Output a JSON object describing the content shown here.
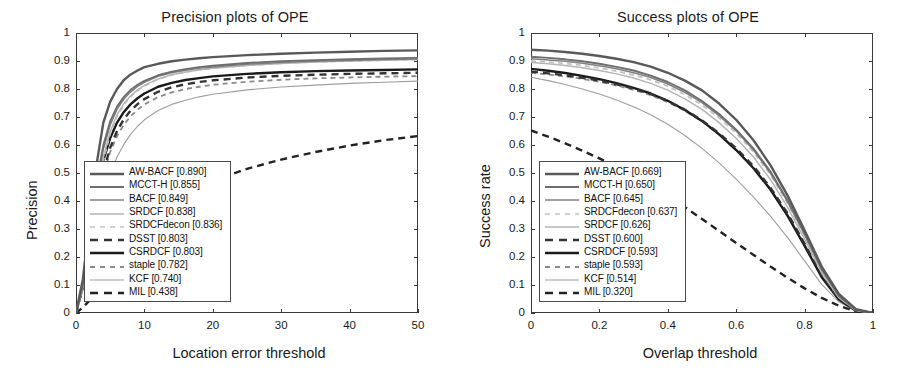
{
  "figure": {
    "background": "#ffffff",
    "panels": [
      "precision",
      "success"
    ]
  },
  "precision_panel": {
    "title": "Precision plots of OPE",
    "xlabel": "Location error threshold",
    "ylabel": "Precision",
    "xticks": [
      "0",
      "10",
      "20",
      "30",
      "40",
      "50"
    ],
    "yticks": [
      "0",
      "0.1",
      "0.2",
      "0.3",
      "0.4",
      "0.5",
      "0.6",
      "0.7",
      "0.8",
      "0.9",
      "1"
    ],
    "legend": [
      {
        "label": "AW-BACF [0.890]",
        "color": "#595959",
        "style": "solid",
        "width": 2.6
      },
      {
        "label": "MCCT-H [0.855]",
        "color": "#6e6e6e",
        "style": "solid",
        "width": 2.0
      },
      {
        "label": "BACF [0.849]",
        "color": "#808080",
        "style": "solid",
        "width": 1.7
      },
      {
        "label": "SRDCF [0.838]",
        "color": "#b5b5b5",
        "style": "solid",
        "width": 1.5
      },
      {
        "label": "SRDCFdecon [0.836]",
        "color": "#c2c2c2",
        "style": "dashed",
        "width": 1.7
      },
      {
        "label": "DSST [0.803]",
        "color": "#333333",
        "style": "dashed",
        "width": 2.6
      },
      {
        "label": "CSRDCF [0.803]",
        "color": "#1a1a1a",
        "style": "solid",
        "width": 2.6
      },
      {
        "label": "staple [0.782]",
        "color": "#8a8a8a",
        "style": "dashed",
        "width": 1.9
      },
      {
        "label": "KCF [0.740]",
        "color": "#9e9e9e",
        "style": "solid",
        "width": 1.2
      },
      {
        "label": "MIL [0.438]",
        "color": "#222222",
        "style": "dashed",
        "width": 2.4
      }
    ]
  },
  "success_panel": {
    "title": "Success plots of OPE",
    "xlabel": "Overlap threshold",
    "ylabel": "Success rate",
    "xticks": [
      "0",
      "0.2",
      "0.4",
      "0.6",
      "0.8",
      "1"
    ],
    "yticks": [
      "0",
      "0.1",
      "0.2",
      "0.3",
      "0.4",
      "0.5",
      "0.6",
      "0.7",
      "0.8",
      "0.9",
      "1"
    ],
    "legend": [
      {
        "label": "AW-BACF [0.669]",
        "color": "#595959",
        "style": "solid",
        "width": 2.6
      },
      {
        "label": "MCCT-H [0.650]",
        "color": "#6e6e6e",
        "style": "solid",
        "width": 2.0
      },
      {
        "label": "BACF [0.645]",
        "color": "#808080",
        "style": "solid",
        "width": 1.7
      },
      {
        "label": "SRDCFdecon [0.637]",
        "color": "#c2c2c2",
        "style": "dashed",
        "width": 1.7
      },
      {
        "label": "SRDCF [0.626]",
        "color": "#b5b5b5",
        "style": "solid",
        "width": 1.5
      },
      {
        "label": "DSST [0.600]",
        "color": "#333333",
        "style": "dashed",
        "width": 2.6
      },
      {
        "label": "CSRDCF [0.593]",
        "color": "#1a1a1a",
        "style": "solid",
        "width": 2.6
      },
      {
        "label": "staple [0.593]",
        "color": "#8a8a8a",
        "style": "dashed",
        "width": 1.9
      },
      {
        "label": "KCF [0.514]",
        "color": "#9e9e9e",
        "style": "solid",
        "width": 1.2
      },
      {
        "label": "MIL [0.320]",
        "color": "#222222",
        "style": "dashed",
        "width": 2.4
      }
    ]
  },
  "chart_data": [
    {
      "type": "line",
      "title": "Precision plots of OPE",
      "xlabel": "Location error threshold",
      "ylabel": "Precision",
      "xlim": [
        0,
        50
      ],
      "ylim": [
        0,
        1
      ],
      "grid": false,
      "legend_position": "lower-left",
      "x": [
        0,
        1,
        2,
        3,
        4,
        5,
        6,
        7,
        8,
        9,
        10,
        12,
        14,
        16,
        18,
        20,
        25,
        30,
        35,
        40,
        45,
        50
      ],
      "series": [
        {
          "name": "AW-BACF",
          "auc": 0.89,
          "color": "#595959",
          "style": "solid",
          "values": [
            0.0,
            0.12,
            0.33,
            0.53,
            0.68,
            0.755,
            0.8,
            0.832,
            0.852,
            0.866,
            0.878,
            0.89,
            0.899,
            0.905,
            0.91,
            0.914,
            0.921,
            0.926,
            0.93,
            0.933,
            0.936,
            0.938
          ]
        },
        {
          "name": "MCCT-H",
          "auc": 0.855,
          "color": "#6e6e6e",
          "style": "solid",
          "values": [
            0.0,
            0.1,
            0.29,
            0.47,
            0.6,
            0.685,
            0.737,
            0.772,
            0.797,
            0.815,
            0.829,
            0.849,
            0.862,
            0.871,
            0.878,
            0.883,
            0.893,
            0.899,
            0.903,
            0.906,
            0.909,
            0.911
          ]
        },
        {
          "name": "BACF",
          "auc": 0.849,
          "color": "#808080",
          "style": "solid",
          "values": [
            0.0,
            0.1,
            0.28,
            0.45,
            0.585,
            0.672,
            0.727,
            0.764,
            0.79,
            0.809,
            0.824,
            0.845,
            0.858,
            0.867,
            0.874,
            0.879,
            0.888,
            0.895,
            0.899,
            0.902,
            0.905,
            0.907
          ]
        },
        {
          "name": "SRDCF",
          "auc": 0.838,
          "color": "#b5b5b5",
          "style": "solid",
          "values": [
            0.0,
            0.09,
            0.25,
            0.42,
            0.555,
            0.648,
            0.708,
            0.748,
            0.776,
            0.797,
            0.813,
            0.836,
            0.851,
            0.861,
            0.868,
            0.874,
            0.884,
            0.891,
            0.896,
            0.9,
            0.903,
            0.905
          ]
        },
        {
          "name": "SRDCFdecon",
          "auc": 0.836,
          "color": "#c2c2c2",
          "style": "dashed",
          "values": [
            0.0,
            0.09,
            0.25,
            0.41,
            0.545,
            0.64,
            0.702,
            0.744,
            0.773,
            0.794,
            0.811,
            0.835,
            0.85,
            0.86,
            0.868,
            0.874,
            0.885,
            0.892,
            0.897,
            0.9,
            0.903,
            0.905
          ]
        },
        {
          "name": "DSST",
          "auc": 0.803,
          "color": "#333333",
          "style": "dashed",
          "values": [
            0.0,
            0.09,
            0.24,
            0.385,
            0.505,
            0.59,
            0.65,
            0.692,
            0.723,
            0.746,
            0.764,
            0.79,
            0.806,
            0.817,
            0.825,
            0.831,
            0.841,
            0.847,
            0.851,
            0.854,
            0.856,
            0.858
          ]
        },
        {
          "name": "CSRDCF",
          "auc": 0.803,
          "color": "#1a1a1a",
          "style": "solid",
          "values": [
            0.0,
            0.1,
            0.27,
            0.43,
            0.545,
            0.625,
            0.68,
            0.718,
            0.746,
            0.767,
            0.784,
            0.808,
            0.822,
            0.832,
            0.839,
            0.845,
            0.854,
            0.86,
            0.864,
            0.866,
            0.868,
            0.87
          ]
        },
        {
          "name": "staple",
          "auc": 0.782,
          "color": "#8a8a8a",
          "style": "dashed",
          "values": [
            0.0,
            0.09,
            0.24,
            0.38,
            0.495,
            0.575,
            0.632,
            0.673,
            0.703,
            0.726,
            0.745,
            0.771,
            0.788,
            0.8,
            0.808,
            0.815,
            0.826,
            0.833,
            0.838,
            0.841,
            0.844,
            0.846
          ]
        },
        {
          "name": "KCF",
          "auc": 0.74,
          "color": "#9e9e9e",
          "style": "solid",
          "values": [
            0.0,
            0.08,
            0.2,
            0.315,
            0.415,
            0.495,
            0.557,
            0.603,
            0.639,
            0.667,
            0.69,
            0.723,
            0.745,
            0.76,
            0.772,
            0.781,
            0.797,
            0.807,
            0.814,
            0.82,
            0.824,
            0.828
          ]
        },
        {
          "name": "MIL",
          "auc": 0.438,
          "color": "#222222",
          "style": "dashed",
          "values": [
            0.0,
            0.02,
            0.045,
            0.075,
            0.11,
            0.145,
            0.18,
            0.215,
            0.248,
            0.278,
            0.305,
            0.352,
            0.392,
            0.425,
            0.45,
            0.472,
            0.515,
            0.548,
            0.575,
            0.598,
            0.617,
            0.632
          ]
        }
      ]
    },
    {
      "type": "line",
      "title": "Success plots of OPE",
      "xlabel": "Overlap threshold",
      "ylabel": "Success rate",
      "xlim": [
        0,
        1
      ],
      "ylim": [
        0,
        1
      ],
      "grid": false,
      "legend_position": "lower-left",
      "x": [
        0,
        0.05,
        0.1,
        0.15,
        0.2,
        0.25,
        0.3,
        0.35,
        0.4,
        0.45,
        0.5,
        0.55,
        0.6,
        0.65,
        0.7,
        0.75,
        0.8,
        0.85,
        0.9,
        0.95,
        1.0
      ],
      "series": [
        {
          "name": "AW-BACF",
          "auc": 0.669,
          "color": "#595959",
          "style": "solid",
          "values": [
            0.94,
            0.937,
            0.932,
            0.926,
            0.918,
            0.908,
            0.896,
            0.88,
            0.858,
            0.83,
            0.795,
            0.748,
            0.69,
            0.618,
            0.528,
            0.42,
            0.295,
            0.166,
            0.068,
            0.014,
            0.0
          ]
        },
        {
          "name": "MCCT-H",
          "auc": 0.65,
          "color": "#6e6e6e",
          "style": "solid",
          "values": [
            0.915,
            0.911,
            0.906,
            0.899,
            0.89,
            0.879,
            0.866,
            0.848,
            0.825,
            0.795,
            0.757,
            0.711,
            0.655,
            0.588,
            0.505,
            0.403,
            0.284,
            0.158,
            0.062,
            0.012,
            0.0
          ]
        },
        {
          "name": "BACF",
          "auc": 0.645,
          "color": "#808080",
          "style": "solid",
          "values": [
            0.908,
            0.904,
            0.899,
            0.892,
            0.883,
            0.872,
            0.858,
            0.841,
            0.818,
            0.788,
            0.751,
            0.705,
            0.65,
            0.583,
            0.5,
            0.398,
            0.28,
            0.154,
            0.06,
            0.011,
            0.0
          ]
        },
        {
          "name": "SRDCFdecon",
          "auc": 0.637,
          "color": "#c2c2c2",
          "style": "dashed",
          "values": [
            0.9,
            0.896,
            0.891,
            0.884,
            0.875,
            0.864,
            0.85,
            0.833,
            0.81,
            0.78,
            0.743,
            0.697,
            0.642,
            0.576,
            0.494,
            0.392,
            0.275,
            0.15,
            0.058,
            0.01,
            0.0
          ]
        },
        {
          "name": "SRDCF",
          "auc": 0.626,
          "color": "#b5b5b5",
          "style": "solid",
          "values": [
            0.895,
            0.89,
            0.884,
            0.876,
            0.866,
            0.854,
            0.839,
            0.82,
            0.796,
            0.765,
            0.727,
            0.68,
            0.624,
            0.558,
            0.477,
            0.378,
            0.264,
            0.143,
            0.055,
            0.009,
            0.0
          ]
        },
        {
          "name": "DSST",
          "auc": 0.6,
          "color": "#333333",
          "style": "dashed",
          "values": [
            0.862,
            0.856,
            0.849,
            0.84,
            0.83,
            0.817,
            0.801,
            0.782,
            0.757,
            0.726,
            0.688,
            0.642,
            0.588,
            0.525,
            0.448,
            0.356,
            0.248,
            0.135,
            0.052,
            0.009,
            0.0
          ]
        },
        {
          "name": "CSRDCF",
          "auc": 0.593,
          "color": "#1a1a1a",
          "style": "solid",
          "values": [
            0.872,
            0.865,
            0.857,
            0.847,
            0.835,
            0.821,
            0.804,
            0.784,
            0.758,
            0.725,
            0.686,
            0.638,
            0.582,
            0.518,
            0.441,
            0.348,
            0.24,
            0.128,
            0.048,
            0.008,
            0.0
          ]
        },
        {
          "name": "staple",
          "auc": 0.593,
          "color": "#8a8a8a",
          "style": "dashed",
          "values": [
            0.858,
            0.852,
            0.845,
            0.836,
            0.826,
            0.813,
            0.797,
            0.778,
            0.753,
            0.722,
            0.684,
            0.637,
            0.582,
            0.519,
            0.443,
            0.351,
            0.244,
            0.132,
            0.051,
            0.009,
            0.0
          ]
        },
        {
          "name": "KCF",
          "auc": 0.514,
          "color": "#9e9e9e",
          "style": "solid",
          "values": [
            0.842,
            0.83,
            0.816,
            0.8,
            0.782,
            0.761,
            0.737,
            0.708,
            0.674,
            0.634,
            0.588,
            0.536,
            0.478,
            0.415,
            0.346,
            0.27,
            0.186,
            0.102,
            0.04,
            0.007,
            0.0
          ]
        },
        {
          "name": "MIL",
          "auc": 0.32,
          "color": "#222222",
          "style": "dashed",
          "values": [
            0.652,
            0.63,
            0.606,
            0.58,
            0.552,
            0.522,
            0.49,
            0.455,
            0.418,
            0.378,
            0.336,
            0.293,
            0.25,
            0.208,
            0.166,
            0.126,
            0.088,
            0.054,
            0.026,
            0.006,
            0.0
          ]
        }
      ]
    }
  ]
}
